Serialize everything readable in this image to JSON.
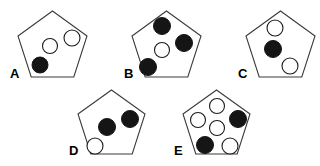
{
  "figure": {
    "background_color": "#ffffff",
    "outline_color": "#3a3a3a",
    "filled_circle_color": "#151515",
    "open_circle_color": "#ffffff",
    "label_color": "#000000",
    "canvas": {
      "width": 320,
      "height": 166
    }
  },
  "items": [
    {
      "label": "A",
      "label_x": 10,
      "label_y": 78,
      "pentagon": {
        "cx": 52.5,
        "cy": 46,
        "radius": 36,
        "points": "52.5,11 87,36 73.8,77 31.2,77 18,36"
      },
      "circles": [
        {
          "name": "circle-center",
          "cx": 50,
          "cy": 46,
          "r": 7.5,
          "fill": "open"
        },
        {
          "name": "circle-upper-right",
          "cx": 72,
          "cy": 38,
          "r": 8,
          "fill": "open"
        },
        {
          "name": "circle-lower-left",
          "cx": 40,
          "cy": 65,
          "r": 8,
          "fill": "filled"
        }
      ],
      "filled_count": 1,
      "open_count": 2,
      "total_count": 3
    },
    {
      "label": "B",
      "label_x": 124,
      "label_y": 78,
      "pentagon": {
        "cx": 166.5,
        "cy": 46,
        "radius": 36,
        "points": "166.5,11 201,36 187.8,77 145.2,77 132,36"
      },
      "circles": [
        {
          "name": "circle-top",
          "cx": 162,
          "cy": 26,
          "r": 8.5,
          "fill": "filled"
        },
        {
          "name": "circle-upper-right",
          "cx": 184,
          "cy": 43,
          "r": 8.5,
          "fill": "filled"
        },
        {
          "name": "circle-center",
          "cx": 162,
          "cy": 50,
          "r": 7.5,
          "fill": "open"
        },
        {
          "name": "circle-lower-left",
          "cx": 148,
          "cy": 67,
          "r": 8.5,
          "fill": "filled"
        }
      ],
      "filled_count": 3,
      "open_count": 1,
      "total_count": 4
    },
    {
      "label": "C",
      "label_x": 238,
      "label_y": 78,
      "pentagon": {
        "cx": 280.5,
        "cy": 46,
        "radius": 36,
        "points": "280.5,11 315,36 301.8,77 259.2,77 246,36"
      },
      "circles": [
        {
          "name": "circle-top",
          "cx": 275,
          "cy": 28,
          "r": 8,
          "fill": "open"
        },
        {
          "name": "circle-center",
          "cx": 273,
          "cy": 49,
          "r": 8.5,
          "fill": "filled"
        },
        {
          "name": "circle-lower-right",
          "cx": 290,
          "cy": 66,
          "r": 8,
          "fill": "open"
        }
      ],
      "filled_count": 1,
      "open_count": 2,
      "total_count": 3
    },
    {
      "label": "D",
      "label_x": 69,
      "label_y": 155,
      "pentagon": {
        "cx": 111.5,
        "cy": 124,
        "radius": 35,
        "points": "111.5,90 145,114 132.2,154 90.8,154 78,114"
      },
      "circles": [
        {
          "name": "circle-center",
          "cx": 107,
          "cy": 127,
          "r": 8.5,
          "fill": "filled"
        },
        {
          "name": "circle-upper-right",
          "cx": 130,
          "cy": 119,
          "r": 8.5,
          "fill": "filled"
        },
        {
          "name": "circle-lower-left",
          "cx": 95,
          "cy": 146,
          "r": 8,
          "fill": "open"
        }
      ],
      "filled_count": 2,
      "open_count": 1,
      "total_count": 3
    },
    {
      "label": "E",
      "label_x": 174,
      "label_y": 155,
      "pentagon": {
        "cx": 216.5,
        "cy": 124,
        "radius": 35,
        "points": "216.5,90 250,114 237.2,154 195.8,154 183,114"
      },
      "circles": [
        {
          "name": "circle-top",
          "cx": 217,
          "cy": 106,
          "r": 7.5,
          "fill": "open"
        },
        {
          "name": "circle-left",
          "cx": 198,
          "cy": 120,
          "r": 7.5,
          "fill": "open"
        },
        {
          "name": "circle-center",
          "cx": 217,
          "cy": 128,
          "r": 7.5,
          "fill": "open"
        },
        {
          "name": "circle-right",
          "cx": 238,
          "cy": 119,
          "r": 8.5,
          "fill": "filled"
        },
        {
          "name": "circle-lower-left",
          "cx": 205,
          "cy": 145,
          "r": 8.5,
          "fill": "filled"
        },
        {
          "name": "circle-lower-right",
          "cx": 230,
          "cy": 146,
          "r": 8,
          "fill": "open"
        }
      ],
      "filled_count": 2,
      "open_count": 4,
      "total_count": 6
    }
  ]
}
